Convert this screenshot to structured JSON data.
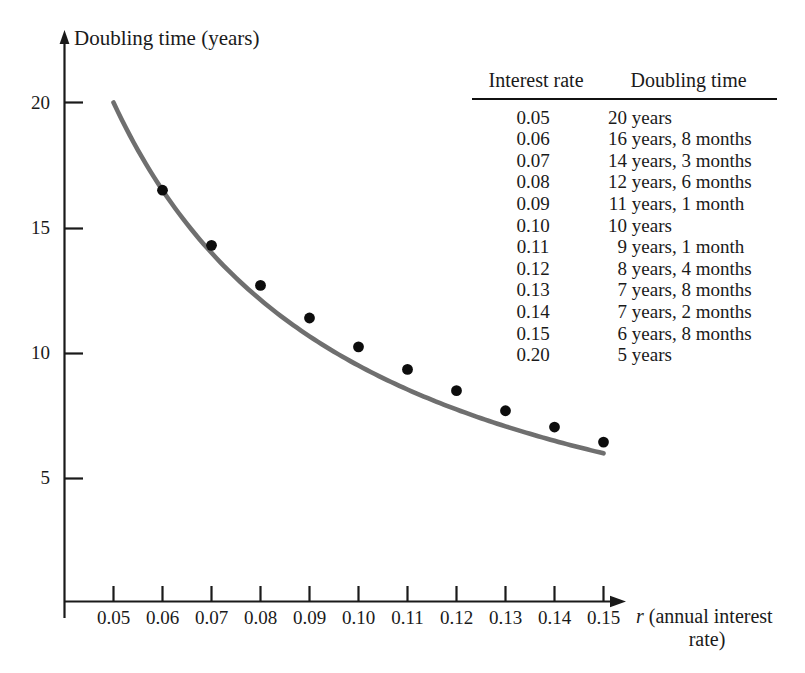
{
  "chart_data": {
    "type": "line",
    "title": "",
    "xlabel": "r (annual interest rate)",
    "ylabel": "Doubling time (years)",
    "xlim": [
      0.0425,
      0.1335
    ],
    "ylim": [
      0,
      21.6
    ],
    "grid": false,
    "legend_position": "none",
    "x_ticks": [
      "0.05",
      "0.06",
      "0.07",
      "0.08",
      "0.09",
      "0.10",
      "0.11",
      "0.12",
      "0.13",
      "0.14",
      "0.15"
    ],
    "x_tick_values": [
      0.05,
      0.06,
      0.07,
      0.08,
      0.09,
      0.1,
      0.11,
      0.12,
      0.13,
      0.14,
      0.15
    ],
    "y_ticks": [
      "20",
      "15",
      "10",
      "5"
    ],
    "y_tick_values": [
      20,
      15,
      10,
      5
    ],
    "x": [
      0.06,
      0.07,
      0.08,
      0.09,
      0.1,
      0.11,
      0.12,
      0.13,
      0.14,
      0.15
    ],
    "values": [
      16.5,
      14.3,
      12.7,
      11.4,
      10.25,
      9.35,
      8.5,
      7.7,
      7.05,
      6.45
    ],
    "series": [
      {
        "name": "Doubling time",
        "marker": "filled-circle",
        "marker_color": "#0d0d0d",
        "line_color": "#6f6f6f",
        "x": [
          0.06,
          0.07,
          0.08,
          0.09,
          0.1,
          0.11,
          0.12,
          0.13,
          0.14,
          0.15
        ],
        "values": [
          16.5,
          14.3,
          12.7,
          11.4,
          10.25,
          9.35,
          8.5,
          7.7,
          7.05,
          6.45
        ]
      }
    ],
    "curve": {
      "description": "Smooth decreasing curve drawn from r=0.05 to r=0.15",
      "x_start": 0.05,
      "x_end": 0.15,
      "y_start": 20.0,
      "y_end": 6.0
    }
  },
  "axes": {
    "y_axis_title": "Doubling time (years)",
    "x_axis_title_variable": "r",
    "x_axis_title_line1": "(annual interest",
    "x_axis_title_line2": "rate)",
    "y_tick_labels": [
      "20",
      "15",
      "10",
      "5"
    ],
    "x_tick_labels": [
      "0.05",
      "0.06",
      "0.07",
      "0.08",
      "0.09",
      "0.10",
      "0.11",
      "0.12",
      "0.13",
      "0.14",
      "0.15"
    ]
  },
  "table": {
    "headers": {
      "rate": "Interest rate",
      "time": "Doubling time"
    },
    "rows": [
      {
        "rate": "0.05",
        "time_num": "20",
        "time_rest": "years"
      },
      {
        "rate": "0.06",
        "time_num": "16",
        "time_rest": "years, 8 months"
      },
      {
        "rate": "0.07",
        "time_num": "14",
        "time_rest": "years, 3 months"
      },
      {
        "rate": "0.08",
        "time_num": "12",
        "time_rest": "years, 6 months"
      },
      {
        "rate": "0.09",
        "time_num": "11",
        "time_rest": "years, 1 month"
      },
      {
        "rate": "0.10",
        "time_num": "10",
        "time_rest": "years"
      },
      {
        "rate": "0.11",
        "time_num": "9",
        "time_rest": "years, 1 month"
      },
      {
        "rate": "0.12",
        "time_num": "8",
        "time_rest": "years, 4 months"
      },
      {
        "rate": "0.13",
        "time_num": "7",
        "time_rest": "years, 8 months"
      },
      {
        "rate": "0.14",
        "time_num": "7",
        "time_rest": "years, 2 months"
      },
      {
        "rate": "0.15",
        "time_num": "6",
        "time_rest": "years, 8 months"
      },
      {
        "rate": "0.20",
        "time_num": "5",
        "time_rest": "years"
      }
    ]
  },
  "colors": {
    "background": "#ffffff",
    "axis": "#1a1a1a",
    "curve": "#6f6f6f",
    "marker": "#0d0d0d",
    "text": "#1a1a1a"
  }
}
